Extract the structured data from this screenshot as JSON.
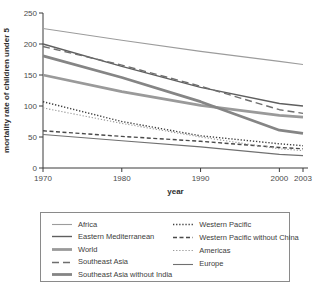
{
  "chart_data": {
    "type": "line",
    "title": "",
    "xlabel": "year",
    "ylabel": "mortality rate of children under 5",
    "x": [
      1970,
      1980,
      1990,
      2000,
      2003
    ],
    "xticks": [
      "1970",
      "1980",
      "1990",
      "2000",
      "2003"
    ],
    "yticks": [
      "0",
      "50",
      "100",
      "150",
      "200",
      "250"
    ],
    "ylim": [
      0,
      250
    ],
    "xlim": [
      1970,
      2003
    ],
    "grid": false,
    "legend_position": "bottom",
    "axis_color": "#3a3a3a",
    "tick_label_color": "#4a4a4a",
    "series": [
      {
        "name": "Africa",
        "values": [
          225,
          206,
          188,
          172,
          167
        ],
        "color": "#9c9c9c",
        "dash": "solid",
        "width": "thin"
      },
      {
        "name": "Eastern Mediterranean",
        "values": [
          200,
          164,
          130,
          104,
          100
        ],
        "color": "#5f5f5f",
        "dash": "solid",
        "width": "medium"
      },
      {
        "name": "World",
        "values": [
          150,
          123,
          101,
          85,
          82
        ],
        "color": "#9a9a9a",
        "dash": "solid",
        "width": "thick"
      },
      {
        "name": "Southeast Asia",
        "values": [
          196,
          166,
          132,
          94,
          88
        ],
        "color": "#6e6e6e",
        "dash": "dashed",
        "width": "medium"
      },
      {
        "name": "Southeast Asia without India",
        "values": [
          181,
          146,
          107,
          61,
          56
        ],
        "color": "#858585",
        "dash": "solid",
        "width": "thick"
      },
      {
        "name": "Western Pacific",
        "values": [
          107,
          75,
          52,
          39,
          36
        ],
        "color": "#3f3f3f",
        "dash": "dotted",
        "width": "medium"
      },
      {
        "name": "Western Pacific without China",
        "values": [
          60,
          51,
          43,
          33,
          31
        ],
        "color": "#4a4a4a",
        "dash": "dash-small",
        "width": "medium"
      },
      {
        "name": "Americas",
        "values": [
          97,
          72,
          50,
          31,
          28
        ],
        "color": "#9a9a9a",
        "dash": "dotted",
        "width": "thin"
      },
      {
        "name": "Europe",
        "values": [
          54,
          44,
          34,
          22,
          20
        ],
        "color": "#707070",
        "dash": "solid",
        "width": "thin"
      }
    ],
    "legend_columns": [
      [
        0,
        1,
        2,
        3,
        4
      ],
      [
        5,
        6,
        7,
        8
      ]
    ]
  }
}
